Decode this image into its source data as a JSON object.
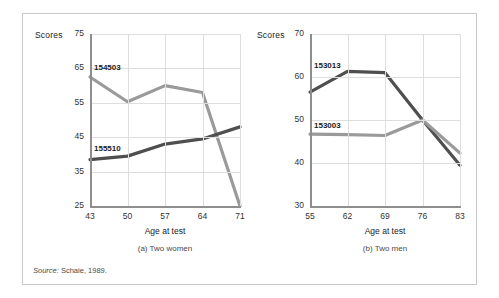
{
  "figure": {
    "source_prefix": "Source:",
    "source_text": " Schaie, 1989."
  },
  "colors": {
    "dark_series": "#4f4f4f",
    "light_series": "#9a9a9a",
    "axis": "#8e8e8e",
    "grid": "#dedede",
    "frame": "#c9c9c9",
    "text": "#1b1b1b",
    "background": "#ffffff"
  },
  "chart_data": [
    {
      "type": "line",
      "id": "panel-a",
      "title": "(a) Two women",
      "xlabel": "Age at test",
      "ylabel": "Scores",
      "categories": [
        43,
        50,
        57,
        64,
        71
      ],
      "xtick_labels": [
        "43",
        "50",
        "57",
        "64",
        "71"
      ],
      "ytick_labels": [
        "75",
        "65",
        "55",
        "45",
        "35",
        "25"
      ],
      "yticks": [
        75,
        65,
        55,
        45,
        35,
        25
      ],
      "ylim": [
        25,
        75
      ],
      "grid": true,
      "legend": "inline-labels",
      "series": [
        {
          "name": "154503",
          "color": "#9a9a9a",
          "label_x": 43,
          "label_y": 65,
          "values": [
            62.5,
            55.3,
            60.0,
            58.0,
            25.0
          ]
        },
        {
          "name": "155510",
          "color": "#4f4f4f",
          "label_x": 43,
          "label_y": 41.5,
          "values": [
            38.5,
            39.5,
            43.0,
            44.5,
            48.0
          ]
        }
      ]
    },
    {
      "type": "line",
      "id": "panel-b",
      "title": "(b) Two men",
      "xlabel": "Age at test",
      "ylabel": "Scores",
      "categories": [
        55,
        62,
        69,
        76,
        83
      ],
      "xtick_labels": [
        "55",
        "62",
        "69",
        "76",
        "83"
      ],
      "ytick_labels": [
        "70",
        "60",
        "50",
        "40",
        "30"
      ],
      "yticks": [
        70,
        60,
        50,
        40,
        30
      ],
      "ylim": [
        30,
        70
      ],
      "grid": true,
      "legend": "inline-labels",
      "series": [
        {
          "name": "153013",
          "color": "#4f4f4f",
          "label_x": 55,
          "label_y": 62.5,
          "values": [
            56.5,
            61.3,
            61.0,
            50.0,
            39.5
          ]
        },
        {
          "name": "153003",
          "color": "#9a9a9a",
          "label_x": 55,
          "label_y": 48.5,
          "values": [
            46.7,
            46.6,
            46.4,
            50.0,
            42.3
          ]
        }
      ]
    }
  ]
}
